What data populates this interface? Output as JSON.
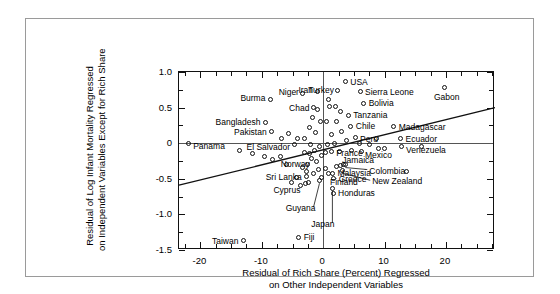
{
  "chart_data": {
    "type": "scatter",
    "title": "",
    "xlabel": "Residual of Rich Share (Percent) Regressed on Other Independent Variables",
    "xlabel_line1": "Residual of Rich Share (Percent) Regressed",
    "xlabel_line2": "on Other Independent Variables",
    "ylabel": "Residual of Log Infant Mortality Regressed on Independent Variables Except for Rich Share",
    "ylabel_line1": "Residual of Log Infant Mortality Regressed",
    "ylabel_line2": "on Independent Variables Except for Rich Share",
    "xlim": [
      -23.5,
      28.0
    ],
    "ylim": [
      -1.5,
      1.0
    ],
    "xticks": [
      -20,
      -10,
      0,
      10,
      20
    ],
    "xticklabels": [
      "-20",
      "-10",
      "0",
      "10",
      "20"
    ],
    "yticks": [
      1.0,
      0.5,
      0,
      -0.5,
      -1.0,
      -1.5
    ],
    "yticklabels": [
      "1.0",
      "0.5",
      "0",
      "-0.5",
      "-1.0",
      "-1.5"
    ],
    "xtick_minor_step": 2.5,
    "ytick_minor_step": 0.125,
    "grid": false,
    "legend": null,
    "zero_lines": {
      "horizontal": 0,
      "vertical": 0
    },
    "regression_line": {
      "x0": -23.5,
      "y0": -0.59,
      "x1": 28.0,
      "y1": 0.5
    },
    "points": [
      {
        "label": "Panama",
        "x": -22.0,
        "y": 0.0,
        "label_dx": 5,
        "label_dy": 3,
        "anchor": "left"
      },
      {
        "label": "Taiwan",
        "x": -13.0,
        "y": -1.37,
        "label_dx": -5,
        "label_dy": 0,
        "anchor": "right"
      },
      {
        "label": "Burma",
        "x": -8.6,
        "y": 0.62,
        "label_dx": -5,
        "label_dy": -1,
        "anchor": "right"
      },
      {
        "label": "Bangladesh",
        "x": -9.4,
        "y": 0.29,
        "label_dx": -5,
        "label_dy": -1,
        "anchor": "right"
      },
      {
        "label": "Pakistan",
        "x": -8.4,
        "y": 0.16,
        "label_dx": -5,
        "label_dy": 0,
        "anchor": "right"
      },
      {
        "label": "El Salvador",
        "x": -4.6,
        "y": -0.02,
        "label_dx": -5,
        "label_dy": 2,
        "anchor": "right"
      },
      {
        "label": "Niger",
        "x": -3.3,
        "y": 0.7,
        "label_dx": -4,
        "label_dy": -1,
        "anchor": "right"
      },
      {
        "label": "Iran",
        "x": -1.0,
        "y": 0.72,
        "label_dx": -4,
        "label_dy": -2,
        "anchor": "right"
      },
      {
        "label": "Chad",
        "x": -1.6,
        "y": 0.5,
        "label_dx": -4,
        "label_dy": 0,
        "anchor": "right"
      },
      {
        "label": "Sri Lanka",
        "x": -2.7,
        "y": -0.47,
        "label_dx": -5,
        "label_dy": 0,
        "anchor": "right"
      },
      {
        "label": "Cyprus",
        "x": -2.9,
        "y": -0.56,
        "label_dx": -5,
        "label_dy": 7,
        "anchor": "right"
      },
      {
        "label": "Norway",
        "x": 0.4,
        "y": -0.35,
        "label_dx": -16,
        "label_dy": -4,
        "anchor": "right"
      },
      {
        "label": "Finland",
        "x": -0.2,
        "y": -0.48,
        "label_dx": 8,
        "label_dy": 5,
        "anchor": "left"
      },
      {
        "label": "Guyana",
        "x": -0.6,
        "y": -0.52,
        "label_dx": -4,
        "label_dy": 28,
        "anchor": "right",
        "leader": true
      },
      {
        "label": "Japan",
        "x": 1.5,
        "y": -0.63,
        "label_dx": 2,
        "label_dy": 36,
        "anchor": "right",
        "leader": true
      },
      {
        "label": "Fiji",
        "x": -4.0,
        "y": -1.32,
        "label_dx": 5,
        "label_dy": 0,
        "anchor": "left"
      },
      {
        "label": "USA",
        "x": 3.6,
        "y": 0.86,
        "label_dx": 5,
        "label_dy": 0,
        "anchor": "left"
      },
      {
        "label": "Turkey",
        "x": 2.4,
        "y": 0.74,
        "label_dx": -4,
        "label_dy": -1,
        "anchor": "right"
      },
      {
        "label": "Sierra Leone",
        "x": 6.0,
        "y": 0.72,
        "label_dx": 5,
        "label_dy": 0,
        "anchor": "left"
      },
      {
        "label": "Bolivia",
        "x": 6.6,
        "y": 0.56,
        "label_dx": 5,
        "label_dy": 0,
        "anchor": "left"
      },
      {
        "label": "Tanzania",
        "x": 4.1,
        "y": 0.39,
        "label_dx": 5,
        "label_dy": 0,
        "anchor": "left"
      },
      {
        "label": "Chile",
        "x": 4.5,
        "y": 0.24,
        "label_dx": 5,
        "label_dy": 0,
        "anchor": "left"
      },
      {
        "label": "Peru",
        "x": 5.2,
        "y": 0.08,
        "label_dx": 5,
        "label_dy": 1,
        "anchor": "left"
      },
      {
        "label": "Gabon",
        "x": 19.8,
        "y": 0.78,
        "label_dx": 2,
        "label_dy": 9,
        "anchor": "center"
      },
      {
        "label": "Madagascar",
        "x": 11.5,
        "y": 0.23,
        "label_dx": 5,
        "label_dy": 0,
        "anchor": "left"
      },
      {
        "label": "Ecuador",
        "x": 12.6,
        "y": 0.06,
        "label_dx": 5,
        "label_dy": 0,
        "anchor": "left"
      },
      {
        "label": "Venezuela",
        "x": 12.7,
        "y": -0.05,
        "label_dx": 5,
        "label_dy": 3,
        "anchor": "left"
      },
      {
        "label": "Mexico",
        "x": 9.0,
        "y": -0.08,
        "label_dx": 0,
        "label_dy": 6,
        "anchor": "center"
      },
      {
        "label": "France",
        "x": 1.3,
        "y": -0.12,
        "label_dx": 5,
        "label_dy": 1,
        "anchor": "left"
      },
      {
        "label": "Jamaica",
        "x": 2.8,
        "y": -0.31,
        "label_dx": 2,
        "label_dy": -5,
        "anchor": "left"
      },
      {
        "label": "Colombia",
        "x": 3.6,
        "y": -0.3,
        "label_dx": 24,
        "label_dy": 6,
        "anchor": "left",
        "leader": true
      },
      {
        "label": "Malaysia",
        "x": 1.5,
        "y": -0.42,
        "label_dx": 5,
        "label_dy": 0,
        "anchor": "left"
      },
      {
        "label": "Greece",
        "x": 1.7,
        "y": -0.5,
        "label_dx": 5,
        "label_dy": 0,
        "anchor": "left"
      },
      {
        "label": "New Zealand",
        "x": 3.1,
        "y": -0.38,
        "label_dx": 30,
        "label_dy": 11,
        "anchor": "left",
        "leader": true
      },
      {
        "label": "Honduras",
        "x": 1.6,
        "y": -0.7,
        "label_dx": 5,
        "label_dy": 0,
        "anchor": "left"
      }
    ],
    "unlabeled_points": [
      {
        "x": -5.6,
        "y": 0.13
      },
      {
        "x": -4.2,
        "y": 0.06
      },
      {
        "x": -3.0,
        "y": 0.06
      },
      {
        "x": -2.3,
        "y": 0.22
      },
      {
        "x": -1.7,
        "y": 0.36
      },
      {
        "x": -0.9,
        "y": 0.47
      },
      {
        "x": -0.5,
        "y": 0.3
      },
      {
        "x": -1.2,
        "y": 0.15
      },
      {
        "x": -2.0,
        "y": -0.02
      },
      {
        "x": -0.6,
        "y": -0.05
      },
      {
        "x": -1.4,
        "y": -0.1
      },
      {
        "x": -2.2,
        "y": -0.14
      },
      {
        "x": -3.1,
        "y": -0.13
      },
      {
        "x": -0.3,
        "y": -0.17
      },
      {
        "x": -1.9,
        "y": -0.22
      },
      {
        "x": -1.1,
        "y": -0.25
      },
      {
        "x": -2.6,
        "y": -0.3
      },
      {
        "x": -0.8,
        "y": -0.37
      },
      {
        "x": -1.6,
        "y": -0.42
      },
      {
        "x": -2.8,
        "y": -0.4
      },
      {
        "x": -3.4,
        "y": -0.34
      },
      {
        "x": -2.4,
        "y": -0.55
      },
      {
        "x": -3.7,
        "y": -0.6
      },
      {
        "x": -4.4,
        "y": -0.48
      },
      {
        "x": -5.2,
        "y": -0.55
      },
      {
        "x": -6.0,
        "y": -0.3
      },
      {
        "x": -7.0,
        "y": -0.19
      },
      {
        "x": -8.2,
        "y": -0.23
      },
      {
        "x": -9.6,
        "y": -0.18
      },
      {
        "x": -11.6,
        "y": -0.14
      },
      {
        "x": -13.6,
        "y": -0.1
      },
      {
        "x": 0.6,
        "y": 0.3
      },
      {
        "x": 1.1,
        "y": 0.52
      },
      {
        "x": 0.9,
        "y": 0.62
      },
      {
        "x": 2.0,
        "y": 0.52
      },
      {
        "x": 2.8,
        "y": 0.44
      },
      {
        "x": 2.2,
        "y": 0.3
      },
      {
        "x": 3.0,
        "y": 0.16
      },
      {
        "x": 1.3,
        "y": 0.12
      },
      {
        "x": 1.9,
        "y": 0.0
      },
      {
        "x": 0.7,
        "y": -0.02
      },
      {
        "x": 3.8,
        "y": 0.04
      },
      {
        "x": 5.9,
        "y": 0.0
      },
      {
        "x": 7.5,
        "y": -0.02
      },
      {
        "x": 8.7,
        "y": 0.06
      },
      {
        "x": 2.6,
        "y": -0.12
      },
      {
        "x": 4.6,
        "y": -0.1
      },
      {
        "x": 6.2,
        "y": -0.12
      },
      {
        "x": 0.3,
        "y": -0.13
      },
      {
        "x": 2.1,
        "y": -0.33
      },
      {
        "x": 3.3,
        "y": -0.3
      },
      {
        "x": 0.9,
        "y": -0.42
      },
      {
        "x": 10.0,
        "y": -0.07
      },
      {
        "x": 16.0,
        "y": -0.05
      },
      {
        "x": 13.6,
        "y": -0.4
      },
      {
        "x": -6.8,
        "y": 0.06
      }
    ]
  }
}
